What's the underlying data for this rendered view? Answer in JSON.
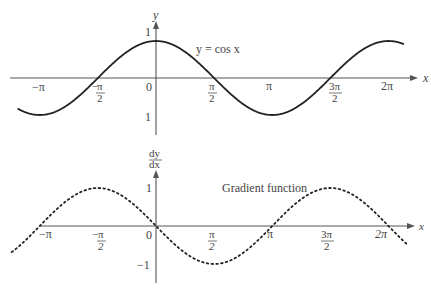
{
  "chart_data": [
    {
      "type": "line",
      "title": "",
      "series": [
        {
          "name": "y = cos x",
          "function": "cos(x)",
          "style": "solid"
        }
      ],
      "curve_label": "y = cos x",
      "xlabel": "x",
      "ylabel": "y",
      "x_range": [
        -3.74,
        6.7
      ],
      "ylim": [
        -1,
        1
      ],
      "x_ticks": [
        "−π",
        "−π/2",
        "0",
        "π/2",
        "π",
        "3π/2",
        "2π"
      ],
      "y_ticks": [
        "1",
        "1"
      ],
      "grid": false
    },
    {
      "type": "line",
      "title": "",
      "series": [
        {
          "name": "Gradient function",
          "function": "-sin(x)",
          "style": "dotted"
        }
      ],
      "curve_label": "Gradient function",
      "xlabel": "x",
      "ylabel": "dy/dx",
      "x_range": [
        -3.9,
        6.8
      ],
      "ylim": [
        -1,
        1
      ],
      "x_ticks": [
        "−π",
        "−π/2",
        "0",
        "π/2",
        "π",
        "3π/2",
        "2π"
      ],
      "y_ticks": [
        "1",
        "−1"
      ],
      "grid": false
    }
  ],
  "top": {
    "y_axis_label": "y",
    "x_axis_label": "x",
    "curve_label": "y = cos x",
    "tick_y_pos": "1",
    "tick_y_neg": "1",
    "origin": "0",
    "tick_neg_pi": "−π",
    "tick_neg_half_pi_num": "π",
    "tick_neg_half_pi_sign": "−",
    "tick_neg_half_pi_den": "2",
    "tick_half_pi_num": "π",
    "tick_half_pi_den": "2",
    "tick_pi": "π",
    "tick_three_half_pi_num": "3π",
    "tick_three_half_pi_den": "2",
    "tick_two_pi": "2π"
  },
  "bottom": {
    "y_axis_label_num": "dy",
    "y_axis_label_den": "dx",
    "x_axis_label": "x",
    "curve_label": "Gradient function",
    "tick_y_pos": "1",
    "tick_y_neg": "−1",
    "origin": "0",
    "tick_neg_pi": "−π",
    "tick_neg_half_pi_num": "π",
    "tick_neg_half_pi_sign": "−",
    "tick_neg_half_pi_den": "2",
    "tick_half_pi_num": "π",
    "tick_half_pi_den": "2",
    "tick_pi": "π",
    "tick_three_half_pi_num": "3π",
    "tick_three_half_pi_den": "2",
    "tick_two_pi": "2π"
  }
}
